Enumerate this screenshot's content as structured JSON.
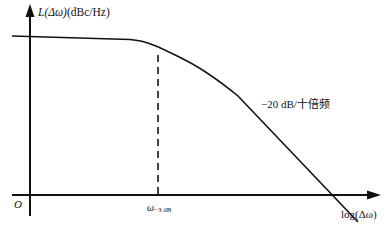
{
  "diagram": {
    "y_axis": {
      "label_func": "L(Δω)",
      "label_unit": "(dBc/Hz)"
    },
    "x_axis": {
      "label": "log(Δω)"
    },
    "origin_label": "O",
    "marker": {
      "symbol": "ω",
      "subscript": "−3 dB"
    },
    "slope_annotation": "−20 dB/十倍频",
    "colors": {
      "line": "#111111",
      "background": "#ffffff"
    }
  }
}
